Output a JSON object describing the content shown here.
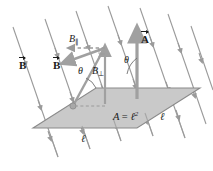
{
  "figure": {
    "colors": {
      "plane_fill": "#c9c9c9",
      "plane_stroke": "#8a8a8a",
      "field_line": "#9a9a9a",
      "vector_gray": "#a0a0a0",
      "text": "#1a1a1a",
      "background": "#ffffff"
    },
    "labels": {
      "b_field_left": "B",
      "b_field_mid": "B",
      "b_parallel": "B",
      "b_parallel_sub": "∥",
      "b_perpendicular": "B",
      "b_perpendicular_sub": "⊥",
      "area_vector": "A",
      "theta_left": "θ",
      "theta_right": "θ",
      "area_equation_lhs": "A",
      "area_equation_eq": "=",
      "area_equation_rhs": "ℓ",
      "area_equation_exp": "2",
      "side_length_bottom": "ℓ",
      "side_length_right": "ℓ"
    },
    "geometry": {
      "plane_vertices": "33,128 96,88 200,88 137,128",
      "field_line_angle_deg": 71,
      "normal_vector_label": "A",
      "area_value": "ℓ²"
    }
  }
}
